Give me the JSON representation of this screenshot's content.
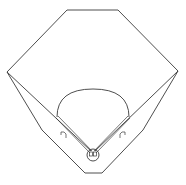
{
  "diagram": {
    "title": "Baseball field outline",
    "stroke_color": "#3a3a3a",
    "background_color": "#ffffff",
    "outfield_fence": {
      "points": [
        [
          7,
          72
        ],
        [
          67,
          10
        ],
        [
          118,
          10
        ],
        [
          178,
          71
        ]
      ]
    },
    "outer_boundary": {
      "points": [
        [
          7,
          72
        ],
        [
          42,
          130
        ],
        [
          85,
          173
        ],
        [
          102,
          173
        ],
        [
          143,
          130
        ],
        [
          178,
          71
        ]
      ]
    },
    "foul_lines": {
      "left": [
        [
          7,
          72
        ],
        [
          93,
          152
        ]
      ],
      "right": [
        [
          178,
          71
        ],
        [
          93,
          152
        ]
      ]
    },
    "baselines": {
      "left": [
        [
          57,
          117
        ],
        [
          91,
          152
        ]
      ],
      "right": [
        [
          129,
          117
        ],
        [
          95,
          152
        ]
      ]
    },
    "infield_arc": {
      "start": [
        57,
        117
      ],
      "end": [
        129,
        117
      ],
      "top_y": 89
    },
    "home_plate_circle": {
      "cx": 93,
      "cy": 155,
      "r": 6
    },
    "dugouts": {
      "left": {
        "x": 61,
        "y": 133
      },
      "right": {
        "x": 121,
        "y": 133
      }
    }
  }
}
